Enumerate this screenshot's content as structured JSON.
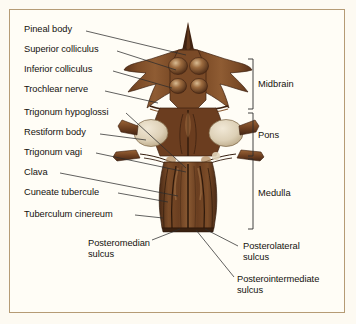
{
  "figure": {
    "background_color": "#fffdf6",
    "border_color": "#b59b75",
    "leader_line_color": "#2c2c2c",
    "art_colors": {
      "dark_brown": "#4a2a16",
      "mid_brown": "#6e3f20",
      "light_brown": "#8a5a34",
      "tan": "#a97c4e",
      "cream": "#e8ddc8",
      "highlight": "#c9a87a"
    }
  },
  "left_labels": [
    {
      "text": "Pineal body",
      "x": 24,
      "y": 29
    },
    {
      "text": "Superior colliculus",
      "x": 24,
      "y": 49
    },
    {
      "text": "Inferior colliculus",
      "x": 24,
      "y": 69
    },
    {
      "text": "Trochlear nerve",
      "x": 24,
      "y": 89
    },
    {
      "text": "Trigonum hypoglossi",
      "x": 24,
      "y": 112
    },
    {
      "text": "Restiform body",
      "x": 24,
      "y": 132
    },
    {
      "text": "Trigonum vagi",
      "x": 24,
      "y": 152
    },
    {
      "text": "Clava",
      "x": 24,
      "y": 172
    },
    {
      "text": "Cuneate tubercule",
      "x": 24,
      "y": 192
    },
    {
      "text": "Tuberculum cinereum",
      "x": 24,
      "y": 214
    }
  ],
  "bracket_labels": [
    {
      "text": "Midbrain",
      "x": 258,
      "y": 79
    },
    {
      "text": "Pons",
      "x": 258,
      "y": 131
    },
    {
      "text": "Medulla",
      "x": 258,
      "y": 188
    }
  ],
  "bottom_labels": [
    {
      "line1": "Posteromedian",
      "line2": "sulcus",
      "x": 88,
      "y": 243
    },
    {
      "line1": "Posterolateral",
      "line2": "sulcus",
      "x": 243,
      "y": 246
    },
    {
      "line1": "Posterointermediate",
      "line2": "sulcus",
      "x": 237,
      "y": 279
    }
  ],
  "brackets": [
    {
      "name": "midbrain",
      "top": 59,
      "bottom": 109
    },
    {
      "name": "pons",
      "top": 113,
      "bottom": 156
    },
    {
      "name": "medulla",
      "top": 159,
      "bottom": 229
    }
  ]
}
